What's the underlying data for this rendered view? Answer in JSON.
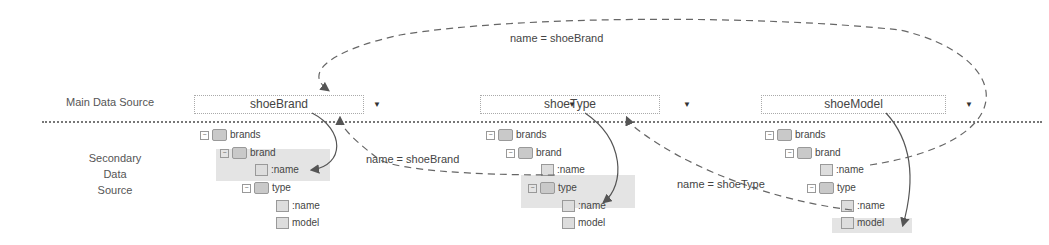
{
  "labels": {
    "main": "Main Data Source",
    "secondary": [
      "Secondary",
      "Data",
      "Source"
    ]
  },
  "dropdowns": [
    {
      "value": "shoeBrand"
    },
    {
      "value": "shoeType"
    },
    {
      "value": "shoeModel"
    }
  ],
  "dropdown_arrow": "▼",
  "tree": {
    "brands": "brands",
    "brand": "brand",
    "name": ":name",
    "type": "type",
    "model": "model",
    "toggle": "−"
  },
  "edges": {
    "top": "name = shoeBrand",
    "mid1": "name = shoeBrand",
    "mid2": "name = shoeType"
  }
}
